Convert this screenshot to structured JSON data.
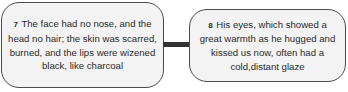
{
  "diagram": {
    "nodes": [
      {
        "id": "7",
        "number": "7",
        "text": "The face had no nose, and the head no hair; the skin was scarred, burned, and the lips were wizened black, like charcoal"
      },
      {
        "id": "8",
        "number": "8",
        "text": "His eyes, which showed a great warmth as he hugged and kissed us now, often had a cold,distant glaze"
      }
    ],
    "edges": [
      {
        "from": "7",
        "to": "8",
        "style": "thick-line"
      }
    ],
    "colors": {
      "box_fill": "#f3f3f3",
      "box_border": "#4a4a4a",
      "connector": "#333333",
      "text": "#2a2a2a"
    }
  }
}
